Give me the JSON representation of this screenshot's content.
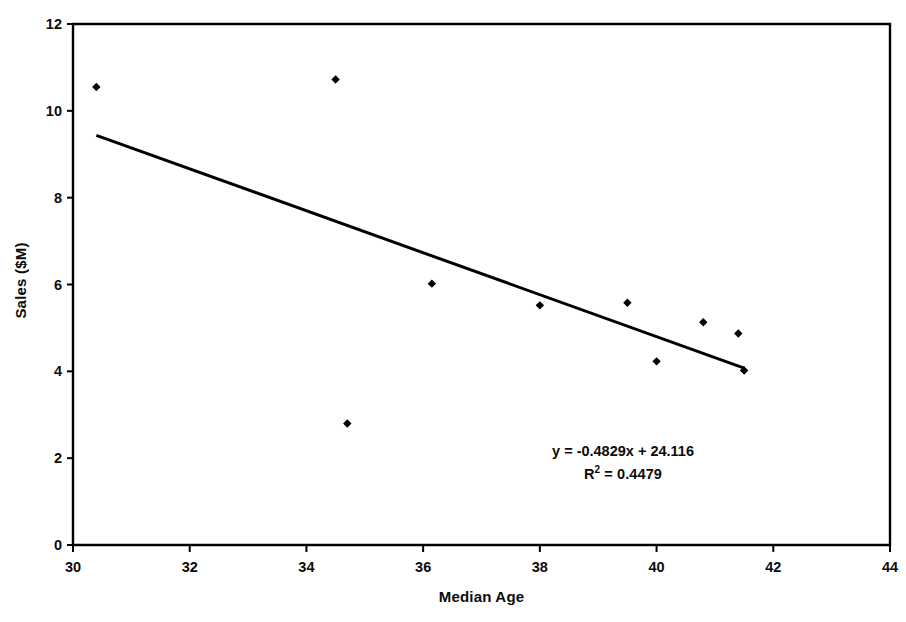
{
  "chart_data": {
    "type": "scatter",
    "title": "",
    "xlabel": "Median Age",
    "ylabel": "Sales ($M)",
    "xlim": [
      30,
      44
    ],
    "ylim": [
      0,
      12
    ],
    "xticks": [
      30,
      32,
      34,
      36,
      38,
      40,
      42,
      44
    ],
    "yticks": [
      0,
      2,
      4,
      6,
      8,
      10,
      12
    ],
    "xtick_labels": [
      "30",
      "32",
      "34",
      "36",
      "38",
      "40",
      "42",
      "44"
    ],
    "ytick_labels": [
      "0",
      "2",
      "4",
      "6",
      "8",
      "10",
      "12"
    ],
    "grid": false,
    "legend": false,
    "legend_position": "none",
    "marker": "diamond",
    "marker_color": "#000000",
    "series": [
      {
        "name": "Sales vs Median Age",
        "points": [
          {
            "x": 30.4,
            "y": 10.55
          },
          {
            "x": 34.5,
            "y": 10.72
          },
          {
            "x": 34.7,
            "y": 2.8
          },
          {
            "x": 36.15,
            "y": 6.02
          },
          {
            "x": 38.0,
            "y": 5.52
          },
          {
            "x": 39.5,
            "y": 5.58
          },
          {
            "x": 40.0,
            "y": 4.23
          },
          {
            "x": 40.8,
            "y": 5.13
          },
          {
            "x": 41.4,
            "y": 4.87
          },
          {
            "x": 41.5,
            "y": 4.02
          }
        ]
      }
    ],
    "trendline": {
      "type": "linear",
      "slope": -0.4829,
      "intercept": 24.116,
      "r_squared": 0.4479,
      "x_start": 30.4,
      "x_end": 41.5,
      "color": "#000000",
      "width": 3
    },
    "annotations": {
      "equation": "y = -0.4829x + 24.116",
      "r_squared_prefix": "R",
      "r_squared_exponent": "2",
      "r_squared_value": " = 0.4479"
    }
  },
  "axes": {
    "frame_color": "#000000",
    "x_axis_title": "Median Age",
    "y_axis_title": "Sales ($M)"
  }
}
